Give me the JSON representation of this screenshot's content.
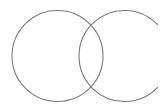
{
  "diagram": {
    "type": "venn",
    "stroke_color": "#7a7a7a",
    "background": "#ffffff",
    "shapes": [
      {
        "name": "left-circle",
        "cx": 57.5,
        "cy": 56,
        "r": 45.5,
        "kind": "circle"
      },
      {
        "name": "right-arc",
        "cx": 124.5,
        "cy": 56,
        "r": 45.5,
        "kind": "arc",
        "gap_side": "right"
      }
    ]
  }
}
